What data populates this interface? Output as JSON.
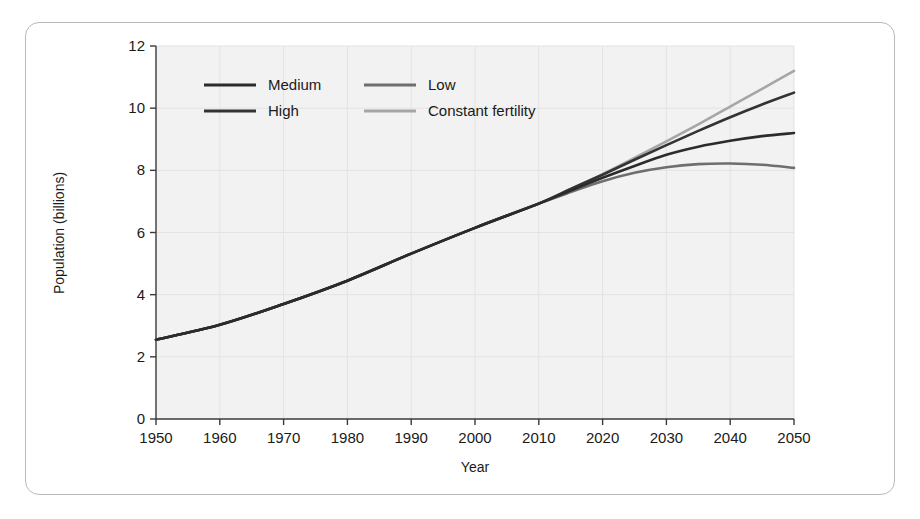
{
  "chart_data": {
    "type": "line",
    "title": "",
    "xlabel": "Year",
    "ylabel": "Population (billions)",
    "xlim": [
      1950,
      2050
    ],
    "ylim": [
      0,
      12
    ],
    "xticks": [
      1950,
      1960,
      1970,
      1980,
      1990,
      2000,
      2010,
      2020,
      2030,
      2040,
      2050
    ],
    "yticks": [
      0,
      2,
      4,
      6,
      8,
      10,
      12
    ],
    "grid": true,
    "legend_position": "top-left-inside",
    "x": [
      1950,
      1960,
      1970,
      1980,
      1990,
      2000,
      2010,
      2015,
      2020,
      2025,
      2030,
      2035,
      2040,
      2045,
      2050
    ],
    "series": [
      {
        "name": "Medium",
        "color": "#2b2b2b",
        "values": [
          2.55,
          3.03,
          3.7,
          4.45,
          5.32,
          6.15,
          6.93,
          7.35,
          7.76,
          8.14,
          8.5,
          8.76,
          8.95,
          9.1,
          9.2
        ]
      },
      {
        "name": "High",
        "color": "#333333",
        "values": [
          2.55,
          3.03,
          3.7,
          4.45,
          5.32,
          6.15,
          6.93,
          7.4,
          7.86,
          8.34,
          8.81,
          9.27,
          9.71,
          10.12,
          10.5
        ]
      },
      {
        "name": "Low",
        "color": "#6e6e6e",
        "values": [
          2.55,
          3.03,
          3.7,
          4.45,
          5.32,
          6.15,
          6.93,
          7.3,
          7.65,
          7.92,
          8.1,
          8.2,
          8.22,
          8.18,
          8.08
        ]
      },
      {
        "name": "Constant fertility",
        "color": "#a6a6a6",
        "values": [
          2.55,
          3.03,
          3.7,
          4.45,
          5.32,
          6.15,
          6.93,
          7.4,
          7.88,
          8.4,
          8.93,
          9.48,
          10.05,
          10.62,
          11.2
        ]
      }
    ]
  },
  "legend": {
    "entries": [
      {
        "label": "Medium",
        "color": "#2b2b2b"
      },
      {
        "label": "Low",
        "color": "#6e6e6e"
      },
      {
        "label": "High",
        "color": "#333333"
      },
      {
        "label": "Constant fertility",
        "color": "#a6a6a6"
      }
    ]
  },
  "axes": {
    "y_title": "Population (billions)",
    "x_title": "Year",
    "y_tick_labels": [
      "0",
      "2",
      "4",
      "6",
      "8",
      "10",
      "12"
    ],
    "x_tick_labels": [
      "1950",
      "1960",
      "1970",
      "1980",
      "1990",
      "2000",
      "2010",
      "2020",
      "2030",
      "2040",
      "2050"
    ]
  },
  "colors": {
    "panel_background": "#f2f2f2",
    "card_border": "#b9b9b9",
    "axis": "#3a3a3a",
    "grid": "#e3e3e3",
    "text": "#1a1a1a"
  }
}
